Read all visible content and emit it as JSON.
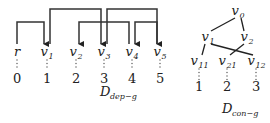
{
  "dep_graph": {
    "caption": {
      "main": "D",
      "sub": "dep−g"
    },
    "nodes": [
      {
        "id": "r",
        "label": "r",
        "sub": "",
        "index": "0"
      },
      {
        "id": "v1",
        "label": "v",
        "sub": "1",
        "index": "1"
      },
      {
        "id": "v2",
        "label": "v",
        "sub": "2",
        "index": "2"
      },
      {
        "id": "v3",
        "label": "v",
        "sub": "3",
        "index": "3"
      },
      {
        "id": "v4",
        "label": "v",
        "sub": "4",
        "index": "4"
      },
      {
        "id": "v5",
        "label": "v",
        "sub": "5",
        "index": "5"
      }
    ],
    "arcs": [
      {
        "from": "r",
        "to": "v1",
        "level": "low"
      },
      {
        "from": "v1",
        "to": "v3",
        "level": "high"
      },
      {
        "from": "v4",
        "to": "v2",
        "level": "low"
      },
      {
        "from": "v3",
        "to": "v5",
        "level": "high"
      },
      {
        "from": "v5",
        "to": "v4",
        "level": "low"
      }
    ]
  },
  "con_graph": {
    "caption": {
      "main": "D",
      "sub": "con−g"
    },
    "nodes": [
      {
        "id": "v0",
        "label": "v",
        "sub": "0"
      },
      {
        "id": "v1",
        "label": "v",
        "sub": "1"
      },
      {
        "id": "v2",
        "label": "v",
        "sub": "2"
      },
      {
        "id": "v11",
        "label": "v",
        "sub": "11",
        "index": "1"
      },
      {
        "id": "v21",
        "label": "v",
        "sub": "21",
        "index": "2"
      },
      {
        "id": "v12",
        "label": "v",
        "sub": "12",
        "index": "3"
      }
    ],
    "edges": [
      {
        "from": "v0",
        "to": "v1"
      },
      {
        "from": "v0",
        "to": "v2"
      },
      {
        "from": "v1",
        "to": "v11"
      },
      {
        "from": "v1",
        "to": "v12"
      },
      {
        "from": "v2",
        "to": "v21"
      }
    ]
  }
}
